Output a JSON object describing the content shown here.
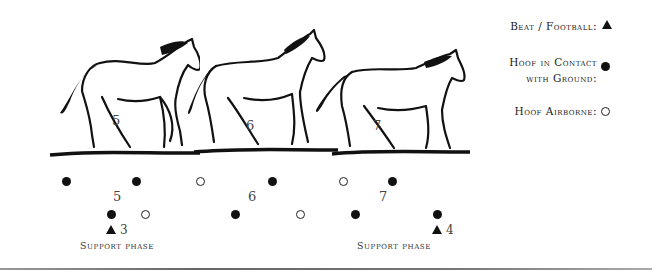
{
  "legend": {
    "beat_label": "Beat / Football:",
    "contact_label_line1": "Hoof in Contact",
    "contact_label_line2": "with Ground:",
    "airborne_label": "Hoof Airborne:"
  },
  "horses": [
    {
      "number": "5"
    },
    {
      "number": "6"
    },
    {
      "number": "7"
    }
  ],
  "footfall_numbers": [
    "5",
    "6",
    "7"
  ],
  "beats": [
    {
      "label": "3"
    },
    {
      "label": "4"
    }
  ],
  "support_phase_labels": [
    "Support Phase",
    "Support Phase"
  ],
  "footfalls": {
    "row1": [
      {
        "x": 66,
        "state": "contact"
      },
      {
        "x": 136,
        "state": "contact"
      },
      {
        "x": 200,
        "state": "airborne"
      },
      {
        "x": 272,
        "state": "contact"
      },
      {
        "x": 343,
        "state": "airborne"
      },
      {
        "x": 392,
        "state": "contact"
      }
    ],
    "row2": [
      {
        "x": 111,
        "state": "contact"
      },
      {
        "x": 145,
        "state": "airborne"
      },
      {
        "x": 235,
        "state": "contact"
      },
      {
        "x": 300,
        "state": "airborne"
      },
      {
        "x": 355,
        "state": "contact"
      },
      {
        "x": 437,
        "state": "contact"
      }
    ]
  }
}
